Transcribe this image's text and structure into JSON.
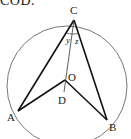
{
  "caption": {
    "text": "COD."
  },
  "diagram": {
    "circle": {
      "cx": 67,
      "cy": 86,
      "r": 60,
      "stroke": "#444444"
    },
    "points": {
      "C": {
        "x": 74,
        "y": 20,
        "label": "C",
        "lx": 70,
        "ly": 14
      },
      "O": {
        "x": 65,
        "y": 80,
        "label": "O",
        "lx": 68,
        "ly": 81
      },
      "D": {
        "x": 64,
        "y": 92,
        "label": "D",
        "lx": 58,
        "ly": 104
      },
      "A": {
        "x": 18,
        "y": 111,
        "label": "A",
        "lx": 7,
        "ly": 121
      },
      "B": {
        "x": 107,
        "y": 120,
        "label": "B",
        "lx": 109,
        "ly": 131
      }
    },
    "angles": {
      "y": {
        "label": "y",
        "x": 66,
        "y": 43
      },
      "z": {
        "label": "z",
        "x": 75,
        "y": 44
      }
    },
    "line_color": "#111111"
  }
}
